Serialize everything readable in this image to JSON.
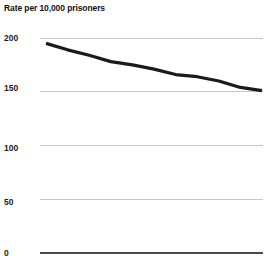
{
  "chart_data": {
    "type": "line",
    "title": "Rate per 10,000 prisoners",
    "subtitle": "",
    "xlabel": "",
    "ylabel": "",
    "ylim": [
      0,
      200
    ],
    "yticks": [
      0,
      50,
      100,
      150,
      200
    ],
    "ytick_labels": [
      "0",
      "50",
      "100",
      "150",
      "200"
    ],
    "xticks": [],
    "xtick_labels": [],
    "grid": true,
    "grid_axis": "y",
    "legend": false,
    "legend_position": "none",
    "x": [
      0,
      1,
      2,
      3,
      4,
      5,
      6,
      7,
      8,
      9,
      10
    ],
    "series": [
      {
        "name": "Rate per 10,000 prisoners",
        "values": [
          195,
          189,
          184,
          178,
          175,
          171,
          166,
          164,
          160,
          154,
          151
        ],
        "color": "#1a1a1a",
        "line_width": 3.2
      }
    ],
    "colors": {
      "line": "#1a1a1a",
      "grid": "#c9c9c9",
      "baseline": "#4a4a4a",
      "text": "#111111",
      "background": "#ffffff"
    },
    "annotations": []
  },
  "axis": {
    "y": {
      "tick_0": "0",
      "tick_1": "50",
      "tick_2": "100",
      "tick_3": "150",
      "tick_4": "200"
    }
  }
}
